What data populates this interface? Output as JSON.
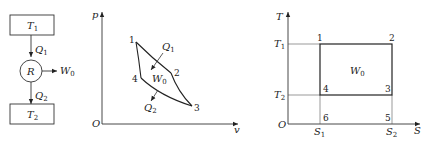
{
  "heat_engine": {
    "hot_reservoir": "T",
    "hot_sub": "1",
    "cold_reservoir": "T",
    "cold_sub": "2",
    "engine": "R",
    "heat_in": "Q",
    "heat_in_sub": "1",
    "heat_out": "Q",
    "heat_out_sub": "2",
    "work": "W",
    "work_sub": "0"
  },
  "pv_diagram": {
    "y_axis": "p",
    "x_axis": "v",
    "origin": "O",
    "points": [
      "1",
      "2",
      "3",
      "4"
    ],
    "heat_in": "Q",
    "heat_in_sub": "1",
    "heat_out": "Q",
    "heat_out_sub": "2",
    "work": "W",
    "work_sub": "0"
  },
  "ts_diagram": {
    "y_axis": "T",
    "x_axis": "S",
    "origin": "O",
    "t1": "T",
    "t1_sub": "1",
    "t2": "T",
    "t2_sub": "2",
    "s1": "S",
    "s1_sub": "1",
    "s2": "S",
    "s2_sub": "2",
    "points": [
      "1",
      "2",
      "3",
      "4",
      "5",
      "6"
    ],
    "work": "W",
    "work_sub": "0"
  }
}
